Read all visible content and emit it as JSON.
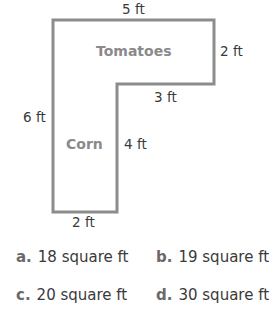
{
  "figure": {
    "dimensions": {
      "top": "5 ft",
      "right": "2 ft",
      "inner_horizontal": "3 ft",
      "left": "6 ft",
      "inner_vertical": "4 ft",
      "bottom": "2 ft"
    },
    "regions": {
      "upper": "Tomatoes",
      "lower": "Corn"
    },
    "colors": {
      "outline": "#8c8c8c",
      "region_text": "#8a8a8a",
      "text": "#3a3a3a"
    }
  },
  "options": [
    {
      "letter": "a.",
      "text": "18 square ft"
    },
    {
      "letter": "b.",
      "text": "19 square ft"
    },
    {
      "letter": "c.",
      "text": "20 square ft"
    },
    {
      "letter": "d.",
      "text": "30 square ft"
    }
  ]
}
